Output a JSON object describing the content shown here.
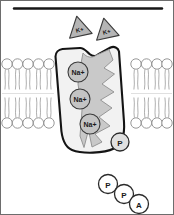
{
  "figure": {
    "border_color": "#1a1a1a",
    "background_color": "#ffffff"
  },
  "top_rule": {
    "label": "extracellular boundary line",
    "color": "#171717"
  },
  "extracellular_ions": {
    "label": "potassium ions outside cell",
    "shape": "triangle",
    "fill_color": "#b5b5b5",
    "stroke_color": "#3a3a3a",
    "items": [
      {
        "label": "K+",
        "x": 79,
        "y": 27,
        "rotation": -12
      },
      {
        "label": "K+",
        "x": 106,
        "y": 29,
        "rotation": -12
      }
    ]
  },
  "membrane": {
    "label": "phospholipid bilayer",
    "head_fill": "#ffffff",
    "head_stroke": "#8c8c8c",
    "tail_stroke": "#9a9a9a",
    "top_head_y": 64,
    "bottom_head_y": 123,
    "head_radius": 5.2,
    "left_heads_x": [
      7,
      17.5,
      28,
      38.5,
      49
    ],
    "right_heads_x": [
      136,
      146.5,
      157,
      167
    ]
  },
  "protein": {
    "label": "Na+/K+ ATPase carrier protein",
    "outer_fill": "#f2f2f2",
    "outer_stroke": "#141414",
    "channel_fill": "#c9c9c9",
    "channel_stroke": "#8f8f8f"
  },
  "sodium_ions": {
    "label": "sodium ions inside channel",
    "fill_color": "#c4c4c4",
    "stroke_color": "#3a3a3a",
    "radius": 10,
    "items": [
      {
        "label": "Na+",
        "x": 78,
        "y": 72
      },
      {
        "label": "Na+",
        "x": 80,
        "y": 99
      },
      {
        "label": "Na+",
        "x": 90,
        "y": 124
      }
    ]
  },
  "bound_phosphate": {
    "label": "P",
    "name": "phosphate group bound to protein",
    "x": 120,
    "y": 142,
    "radius": 9,
    "fill_color": "#e0e0e0",
    "stroke_color": "#2a2a2a"
  },
  "atp": {
    "label": "ATP molecule",
    "fill_color": "#ffffff",
    "stroke_color": "#2a2a2a",
    "radius": 9.5,
    "items": [
      {
        "label": "P",
        "x": 108,
        "y": 184
      },
      {
        "label": "P",
        "x": 124,
        "y": 194
      },
      {
        "label": "A",
        "x": 139,
        "y": 204
      }
    ]
  }
}
